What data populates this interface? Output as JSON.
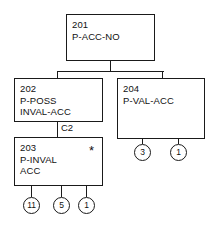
{
  "diagram": {
    "nodes": [
      {
        "id": "201",
        "number": "201",
        "name_line1": "P-ACC-NO",
        "name_line2": "",
        "marker": ""
      },
      {
        "id": "202",
        "number": "202",
        "name_line1": "P-POSS",
        "name_line2": "INVAL-ACC",
        "marker": ""
      },
      {
        "id": "204",
        "number": "204",
        "name_line1": "P-VAL-ACC",
        "name_line2": "",
        "marker": ""
      },
      {
        "id": "203",
        "number": "203",
        "name_line1": "P-INVAL",
        "name_line2": "ACC",
        "marker": "*"
      }
    ],
    "edge_labels": [
      {
        "id": "c2",
        "text": "C2"
      }
    ],
    "terminals": [
      {
        "id": "t-203-1",
        "text": "11"
      },
      {
        "id": "t-203-2",
        "text": "5"
      },
      {
        "id": "t-203-3",
        "text": "1"
      },
      {
        "id": "t-204-1",
        "text": "3"
      },
      {
        "id": "t-204-2",
        "text": "1"
      }
    ],
    "colors": {
      "stroke": "#1a1a1a",
      "text": "#111111",
      "background": "#ffffff"
    }
  }
}
